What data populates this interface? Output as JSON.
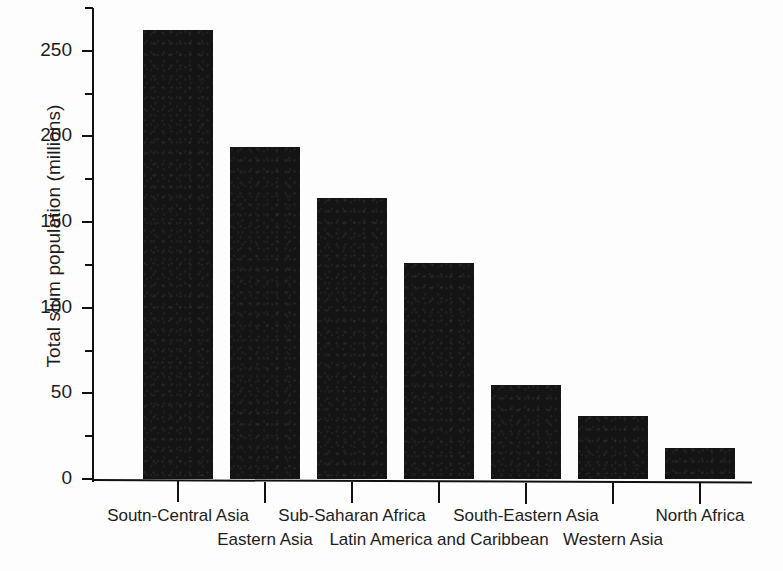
{
  "chart_data": {
    "type": "bar",
    "title": "",
    "xlabel": "",
    "ylabel": "Total slum population (millions)",
    "categories": [
      "Soutn-Central Asia",
      "Eastern Asia",
      "Sub-Saharan Africa",
      "Latin America and Caribbean",
      "South-Eastern Asia",
      "Western Asia",
      "North Africa"
    ],
    "values": [
      262,
      194,
      164,
      126,
      55,
      37,
      18
    ],
    "ylim": [
      0,
      275
    ],
    "y_ticks": [
      0,
      50,
      100,
      150,
      200,
      250
    ],
    "y_tick_labels": [
      "0",
      "50",
      "100",
      "150",
      "200",
      "250"
    ],
    "y_minor_ticks": [
      25,
      75,
      125,
      175,
      225,
      275
    ],
    "grid": false,
    "legend": false,
    "legend_position": "none",
    "bar_color": "#141414",
    "axis_color": "#111111",
    "background_color": "#fdfdfd",
    "label_layout": "staggered-two-rows",
    "label_rows": [
      0,
      1,
      0,
      1,
      0,
      1,
      0
    ]
  }
}
